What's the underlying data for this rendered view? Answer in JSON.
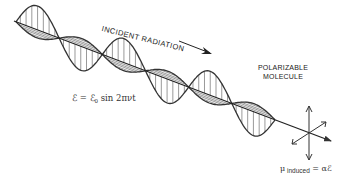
{
  "diagram": {
    "labels": {
      "incident": "INCIDENT RADIATION",
      "molecule_line1": "POLARIZABLE",
      "molecule_line2": "MOLECULE"
    },
    "equations": {
      "field_lhs": "ℰ = ℰ",
      "field_sub": "0",
      "field_rhs": " sin 2πνt",
      "dipole_mu": "μ",
      "dipole_sub": " induced",
      "dipole_rhs": " = αℰ"
    },
    "icons": [
      "propagation-arrow-icon",
      "polarization-arrows-icon"
    ],
    "colors": {
      "line": "#333333",
      "hatch": "#555555",
      "background": "#ffffff"
    }
  }
}
